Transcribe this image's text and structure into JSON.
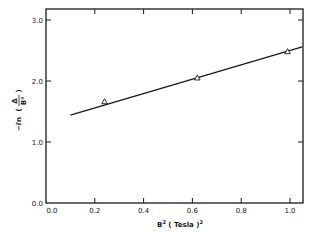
{
  "chart_data": {
    "type": "line",
    "title": "",
    "xlabel": "B² ( Tesla )²",
    "xlabel_parts": {
      "base": "B",
      "sup": "2",
      "mid": " ( Tesla )",
      "sup2": "2"
    },
    "ylabel": "−ℓn ( Δ / B⁴ )",
    "ylabel_parts": {
      "prefix": "−ℓn",
      "num": "Δ",
      "den": "B⁴"
    },
    "xlim": [
      0.0,
      1.05
    ],
    "ylim": [
      0.0,
      3.2
    ],
    "xticks": [
      0.0,
      0.2,
      0.4,
      0.6,
      0.8,
      1.0
    ],
    "xtick_labels": [
      "0.0",
      "0.2",
      "0.4",
      "0.6",
      "0.8",
      "1.0"
    ],
    "yticks": [
      0.0,
      1.0,
      2.0,
      3.0
    ],
    "ytick_labels": [
      "0.0",
      "1.0",
      "2.0",
      "3.0"
    ],
    "grid": false,
    "legend": null,
    "series": [
      {
        "name": "measured",
        "marker": "triangle",
        "x": [
          0.24,
          0.62,
          0.99
        ],
        "y": [
          1.66,
          2.05,
          2.48
        ]
      },
      {
        "name": "linear fit",
        "style": "solid-line",
        "x": [
          0.1,
          1.05
        ],
        "y": [
          1.44,
          2.56
        ]
      }
    ]
  }
}
